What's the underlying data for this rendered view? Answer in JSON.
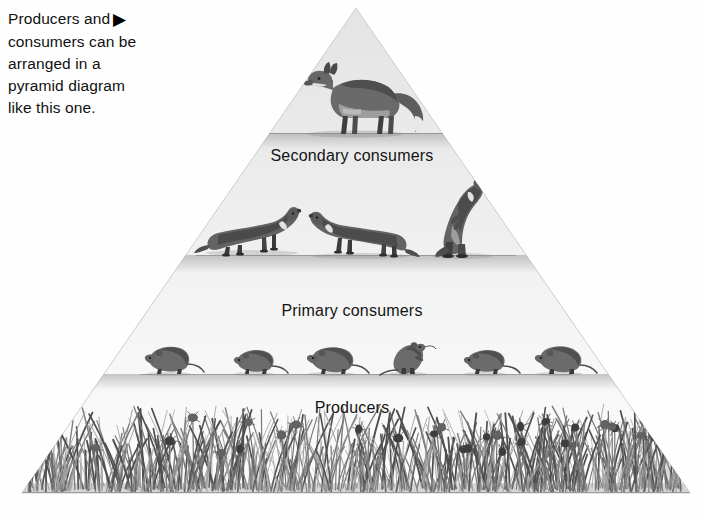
{
  "caption": {
    "lines": [
      "Producers and",
      "consumers can be",
      "arranged in a",
      "pyramid diagram",
      "like this one."
    ],
    "arrow_icon": "play-triangle-right-icon",
    "arrow_glyph": "▶"
  },
  "diagram": {
    "type": "energy-pyramid",
    "shape": "triangle",
    "apex": {
      "x": 356,
      "y": 8
    },
    "base_left": {
      "x": 22,
      "y": 493
    },
    "base_right": {
      "x": 690,
      "y": 493
    },
    "fill_top_color": "#e6e6e6",
    "fill_bottom_color": "#fbfbfb",
    "outline_color": "#c9c9c9",
    "tiers": [
      {
        "index": 0,
        "label": "",
        "organism": "red fox",
        "organism_icon": "fox-icon",
        "count": 1,
        "ground_line_y": 133,
        "trophic_level": "tertiary consumer"
      },
      {
        "index": 1,
        "label": "Secondary consumers",
        "organism": "weasel",
        "organism_icon": "weasel-icon",
        "count": 3,
        "ground_line_y": 255,
        "trophic_level": "secondary consumer"
      },
      {
        "index": 2,
        "label": "Primary consumers",
        "organism": "mouse",
        "organism_icon": "mouse-icon",
        "count": 6,
        "ground_line_y": 374,
        "trophic_level": "primary consumer"
      },
      {
        "index": 3,
        "label": "Producers",
        "organism": "grass and clover",
        "organism_icon": "grass-icon",
        "count": 0,
        "ground_line_y": 493,
        "trophic_level": "producer"
      }
    ]
  },
  "labels": {
    "secondary": "Secondary consumers",
    "primary": "Primary consumers",
    "producers": "Producers"
  }
}
